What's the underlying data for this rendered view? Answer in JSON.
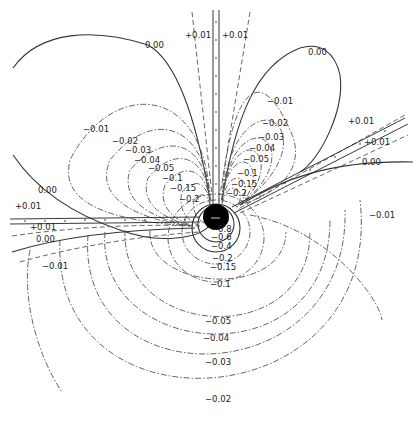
{
  "diagram": {
    "type": "contour-field",
    "center": {
      "x": 216,
      "y": 217
    },
    "labels": {
      "top_plus_left": "+0.01",
      "top_plus_right": "+0.01",
      "zero_top_left": "0.00",
      "zero_top_right": "0.00",
      "zero_right": "0.00",
      "zero_left_upper": "0.00",
      "zero_left_lower": "0.00",
      "plus_right_upper": "+0.01",
      "plus_right_lower": "+0.01",
      "plus_left_upper": "+0.01",
      "plus_left_lower": "+0.01",
      "neg_001_right_top": "−0.01",
      "neg_002_right": "−0.02",
      "neg_003_right": "−0.03",
      "neg_004_right": "−0.04",
      "neg_005_right": "−0.05",
      "neg_01_right": "−0.1",
      "neg_015_right": "−0.15",
      "neg_02_right": "−0.2",
      "neg_001_left": "−0.01",
      "neg_002_left": "−0.02",
      "neg_003_left": "−0.03",
      "neg_004_left": "−0.04",
      "neg_005_left": "−0.05",
      "neg_01_left": "−0.1",
      "neg_015_left": "−0.15",
      "neg_02_left": "−0.2",
      "neg_001_right_far": "−0.01",
      "neg_001_left_low": "−0.01",
      "low_08": "−0.8",
      "low_06": "−0.6",
      "low_04": "−0.4",
      "low_02": "−0.2",
      "low_015": "−0.15",
      "low_01": "−0.1",
      "low_005": "−0.05",
      "low_004": "−0.04",
      "low_003": "−0.03",
      "low_002": "−0.02"
    },
    "colors": {
      "line": "#333333",
      "core": "#000000",
      "background": "#ffffff"
    }
  }
}
